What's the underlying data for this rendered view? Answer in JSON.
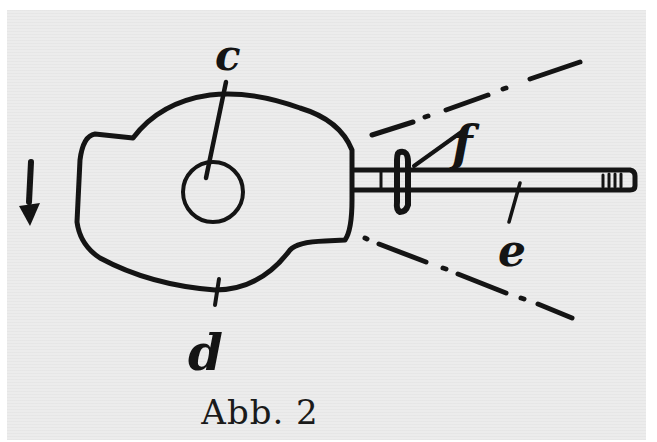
{
  "figure": {
    "caption": "Abb. 2",
    "labels": {
      "c": "c",
      "d": "d",
      "e": "e",
      "f": "f"
    },
    "elements": [
      {
        "id": "cam-body",
        "description": "irregular cam/eccentric outline with a notch at upper left"
      },
      {
        "id": "hub-circle",
        "description": "small circle at center of cam"
      },
      {
        "id": "rod",
        "description": "long horizontal rod extending right from cam"
      },
      {
        "id": "collar",
        "description": "collar/clamp on rod near cam"
      },
      {
        "id": "rod-end-threads",
        "description": "hatch marks at right end of rod"
      },
      {
        "id": "upper-dash-dot-line",
        "description": "dash-dot line diverging upward"
      },
      {
        "id": "lower-dash-dot-line",
        "description": "dash-dot line diverging downward"
      },
      {
        "id": "rotation-arrow",
        "description": "downward arrow at left indicating direction"
      }
    ],
    "colors": {
      "ink": "#141414",
      "paper": "#ececec",
      "margin": "#ffffff"
    }
  }
}
